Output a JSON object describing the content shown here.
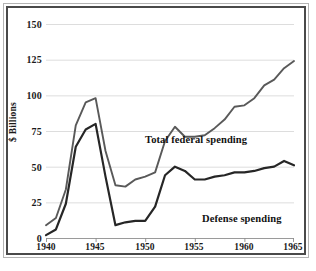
{
  "figure": {
    "y_axis_title": "$ Billions",
    "frame_color": "#4a4a4a",
    "grid_color": "#d9d9d9",
    "background": "#ffffff"
  },
  "axes": {
    "y_ticks": [
      "150",
      "125",
      "100",
      "75",
      "50",
      "25",
      "0"
    ],
    "x_ticks": [
      "1940",
      "1945",
      "1950",
      "1955",
      "1960",
      "1965"
    ]
  },
  "annotations": {
    "total_label": "Total federal spending",
    "defense_label": "Defense spending"
  },
  "chart_data": {
    "type": "line",
    "title": "",
    "subtitle": "",
    "xlabel": "",
    "ylabel": "$ Billions",
    "xlim": [
      1940,
      1965
    ],
    "ylim": [
      0,
      150
    ],
    "x_tick_values": [
      1940,
      1945,
      1950,
      1955,
      1960,
      1965
    ],
    "y_tick_values": [
      0,
      25,
      50,
      75,
      100,
      125,
      150
    ],
    "grid": "horizontal",
    "legend_position": "inline-annotations",
    "x": [
      1940,
      1941,
      1942,
      1943,
      1944,
      1945,
      1946,
      1947,
      1948,
      1949,
      1950,
      1951,
      1952,
      1953,
      1954,
      1955,
      1956,
      1957,
      1958,
      1959,
      1960,
      1961,
      1962,
      1963,
      1964,
      1965
    ],
    "series": [
      {
        "name": "Total federal spending",
        "color": "#595959",
        "values": [
          9,
          14,
          34,
          79,
          95,
          98,
          61,
          37,
          36,
          41,
          43,
          46,
          68,
          78,
          71,
          71,
          72,
          77,
          83,
          92,
          93,
          98,
          107,
          111,
          119,
          124
        ]
      },
      {
        "name": "Defense spending",
        "color": "#262626",
        "values": [
          2,
          6,
          24,
          64,
          76,
          80,
          43,
          9,
          11,
          12,
          12,
          22,
          44,
          50,
          47,
          41,
          41,
          43,
          44,
          46,
          46,
          47,
          49,
          50,
          54,
          51
        ]
      }
    ]
  }
}
